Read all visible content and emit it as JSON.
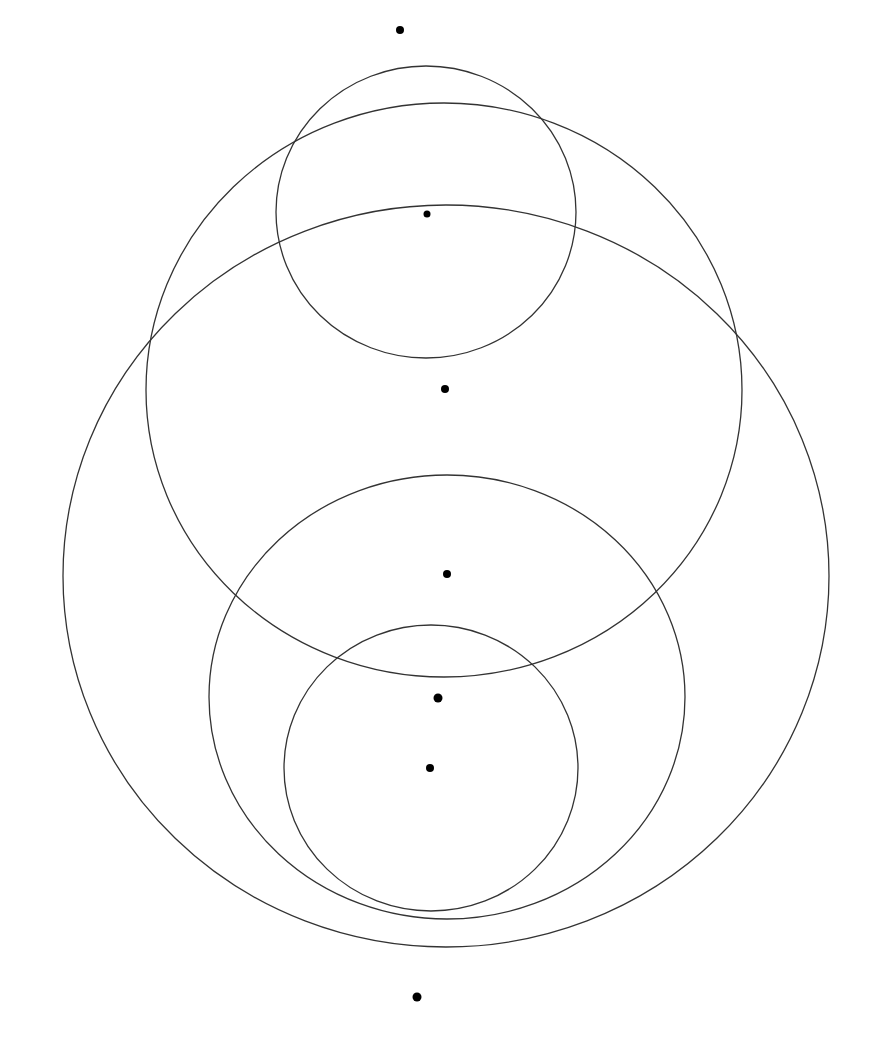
{
  "diagram": {
    "type": "nested-circles-with-points",
    "stroke_color": "#333333",
    "point_color": "#000000",
    "circles": [
      {
        "id": "top-small",
        "cx": 426,
        "cy": 212,
        "rx": 150,
        "ry": 146
      },
      {
        "id": "upper-medium",
        "cx": 444,
        "cy": 390,
        "rx": 298,
        "ry": 287
      },
      {
        "id": "outer-large",
        "cx": 446,
        "cy": 576,
        "rx": 383,
        "ry": 371
      },
      {
        "id": "lower-medium",
        "cx": 447,
        "cy": 697,
        "rx": 238,
        "ry": 222
      },
      {
        "id": "lower-small",
        "cx": 431,
        "cy": 768,
        "rx": 147,
        "ry": 143
      }
    ],
    "points": [
      {
        "x": 400,
        "y": 30,
        "r": 4
      },
      {
        "x": 427,
        "y": 214,
        "r": 3.5
      },
      {
        "x": 445,
        "y": 389,
        "r": 4
      },
      {
        "x": 447,
        "y": 574,
        "r": 4
      },
      {
        "x": 438,
        "y": 698,
        "r": 4.5
      },
      {
        "x": 430,
        "y": 768,
        "r": 4
      },
      {
        "x": 417,
        "y": 997,
        "r": 4.5
      }
    ]
  }
}
